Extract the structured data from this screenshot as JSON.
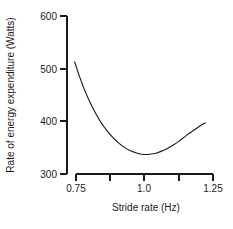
{
  "chart_data": {
    "type": "line",
    "title": "",
    "xlabel": "Stride rate (Hz)",
    "ylabel": "Rate of energy expenditure (Watts)",
    "xlim": [
      0.75,
      1.25
    ],
    "ylim": [
      300,
      600
    ],
    "grid": false,
    "legend": "none",
    "x_ticks": [
      0.75,
      0.875,
      1.0,
      1.125,
      1.25
    ],
    "x_tick_labels": [
      "0.75",
      "",
      "1.0",
      "",
      "1.25"
    ],
    "y_ticks": [
      300,
      400,
      500,
      600
    ],
    "y_tick_labels": [
      "300",
      "400",
      "500",
      "600"
    ],
    "series": [
      {
        "name": "Energy expenditure",
        "x": [
          0.745,
          0.765,
          0.785,
          0.805,
          0.825,
          0.845,
          0.865,
          0.885,
          0.905,
          0.925,
          0.945,
          0.965,
          0.985,
          1.005,
          1.025,
          1.045,
          1.065,
          1.085,
          1.105,
          1.125,
          1.145,
          1.165,
          1.185,
          1.205,
          1.222
        ],
        "y": [
          513,
          482,
          455,
          432,
          412,
          395,
          381,
          369,
          359,
          351,
          345,
          341,
          338,
          337,
          338,
          340,
          344,
          349,
          355,
          362,
          370,
          378,
          385,
          392,
          397
        ]
      }
    ],
    "annotations": {
      "minimum_x": 1.0,
      "minimum_y": 337
    }
  },
  "axis_labels": {
    "x_title": "Stride rate (Hz)",
    "y_title": "Rate of energy expenditure (Watts)",
    "x_tick_0": "0.75",
    "x_tick_1": "1.0",
    "x_tick_2": "1.25",
    "y_tick_0": "300",
    "y_tick_1": "400",
    "y_tick_2": "500",
    "y_tick_3": "600"
  },
  "colors": {
    "curve": "#1a1a1a",
    "axis": "#1a1a1a",
    "background": "#ffffff"
  }
}
